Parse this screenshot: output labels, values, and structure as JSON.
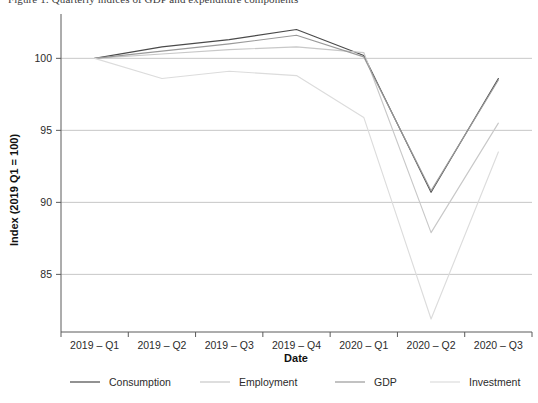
{
  "figure": {
    "caption": "Figure 1: Quarterly indices of GDP and expenditure components"
  },
  "chart_data": {
    "type": "line",
    "title": "",
    "xlabel": "Date",
    "ylabel": "Index (2019 Q1 = 100)",
    "categories": [
      "2019 – Q1",
      "2019 – Q2",
      "2019 – Q3",
      "2019 – Q4",
      "2020 – Q1",
      "2020 – Q2",
      "2020 – Q3"
    ],
    "yticks": [
      85,
      90,
      95,
      100
    ],
    "ytick_labels": [
      "85",
      "90",
      "95",
      "100"
    ],
    "ylim": [
      81.0,
      102.8
    ],
    "grid": true,
    "legend_position": "bottom",
    "series": [
      {
        "name": "Consumption",
        "color": "#4a4a4a",
        "values": [
          100.0,
          100.8,
          101.3,
          102.0,
          100.2,
          90.7,
          98.6
        ]
      },
      {
        "name": "Employment",
        "color": "#c8c8c8",
        "values": [
          100.0,
          100.3,
          100.6,
          100.8,
          100.4,
          87.9,
          95.5
        ]
      },
      {
        "name": "GDP",
        "color": "#9a9a9a",
        "values": [
          100.0,
          100.5,
          101.0,
          101.6,
          100.1,
          90.8,
          98.5
        ]
      },
      {
        "name": "Investment",
        "color": "#dcdcdc",
        "values": [
          100.0,
          98.6,
          99.1,
          98.8,
          95.9,
          81.9,
          93.5
        ]
      }
    ]
  }
}
